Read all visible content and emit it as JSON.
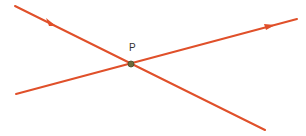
{
  "diagram": {
    "title": "",
    "point_label": "P",
    "line_color": "#e0502a",
    "point_color": "#6b6b3a",
    "lines": [
      {
        "name": "line-1",
        "direction": "down-right",
        "arrow": "forward"
      },
      {
        "name": "line-2",
        "direction": "up-right",
        "arrow": "forward"
      }
    ]
  }
}
